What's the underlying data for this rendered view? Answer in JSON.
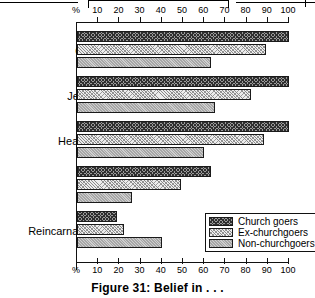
{
  "caption": "Figure 31:  Belief in . . .",
  "axis": {
    "unit_label": "%",
    "ticks": [
      10,
      20,
      30,
      40,
      50,
      60,
      70,
      80,
      90,
      100
    ]
  },
  "legend": {
    "items": [
      {
        "label": "Church goers",
        "pattern": "dense-crosshatch",
        "color": "#9a9a9a"
      },
      {
        "label": "Ex-churchgoers",
        "pattern": "light-speckle",
        "color": "#ececec"
      },
      {
        "label": "Non-churchgoers",
        "pattern": "medium-gray",
        "color": "#a7a7a7"
      }
    ]
  },
  "chart_data": {
    "type": "bar",
    "orientation": "horizontal",
    "title": "Figure 31:  Belief in . . .",
    "xlabel": "%",
    "ylabel": "",
    "xlim": [
      0,
      100
    ],
    "grid": false,
    "legend_position": "bottom-right",
    "categories": [
      "God",
      "Jesus",
      "Heaven",
      "Hell",
      "Reincarnation"
    ],
    "series": [
      {
        "name": "Church goers",
        "values": [
          100,
          100,
          100,
          63,
          19
        ]
      },
      {
        "name": "Ex-churchgoers",
        "values": [
          89,
          82,
          88,
          49,
          22
        ]
      },
      {
        "name": "Non-churchgoers",
        "values": [
          63,
          65,
          60,
          26,
          40
        ]
      }
    ]
  }
}
